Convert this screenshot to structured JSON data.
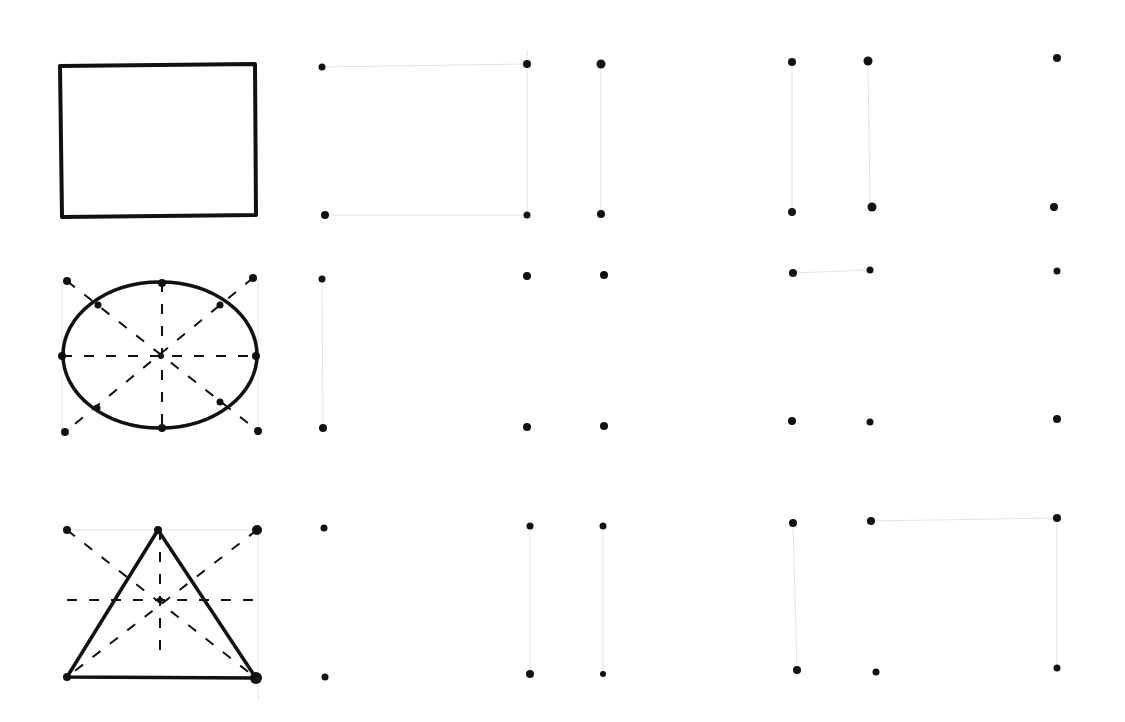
{
  "worksheet": {
    "type": "hand-drawn shape copying worksheet",
    "rows": [
      {
        "model_shape": "rectangle",
        "model_outline": [
          [
            60,
            66
          ],
          [
            255,
            64
          ],
          [
            256,
            215
          ],
          [
            62,
            217
          ]
        ],
        "guide_points": [],
        "guide_lines": [],
        "dot_grids": [
          {
            "dots": [
              [
                322,
                67
              ],
              [
                527,
                64
              ],
              [
                601,
                64
              ],
              [
                325,
                215
              ],
              [
                527,
                215
              ],
              [
                601,
                214
              ]
            ]
          },
          {
            "dots": [
              [
                792,
                62
              ],
              [
                868,
                61
              ],
              [
                1057,
                58
              ],
              [
                792,
                212
              ],
              [
                872,
                207
              ],
              [
                1054,
                207
              ]
            ]
          }
        ]
      },
      {
        "model_shape": "ellipse",
        "model_outline": {
          "cx": 160,
          "cy": 355,
          "rx": 98,
          "ry": 73
        },
        "guide_points": [
          [
            67,
            281
          ],
          [
            253,
            278
          ],
          [
            65,
            432
          ],
          [
            258,
            431
          ],
          [
            162,
            282
          ],
          [
            62,
            356
          ],
          [
            256,
            356
          ],
          [
            162,
            428
          ],
          [
            98,
            305
          ],
          [
            220,
            305
          ],
          [
            97,
            408
          ],
          [
            220,
            402
          ],
          [
            160,
            355
          ]
        ],
        "guide_lines": "dashed diagonals, horizontal and vertical through center",
        "dot_grids": [
          {
            "dots": [
              [
                322,
                279
              ],
              [
                527,
                276
              ],
              [
                604,
                275
              ],
              [
                323,
                428
              ],
              [
                527,
                427
              ],
              [
                604,
                426
              ]
            ]
          },
          {
            "dots": [
              [
                793,
                273
              ],
              [
                870,
                270
              ],
              [
                1057,
                271
              ],
              [
                792,
                421
              ],
              [
                870,
                422
              ],
              [
                1057,
                419
              ]
            ]
          }
        ]
      },
      {
        "model_shape": "triangle",
        "model_outline": [
          [
            158,
            530
          ],
          [
            67,
            677
          ],
          [
            256,
            678
          ]
        ],
        "guide_points": [
          [
            67,
            530
          ],
          [
            257,
            530
          ],
          [
            158,
            600
          ]
        ],
        "guide_lines": "dashed diagonals, horizontal and vertical through center",
        "dot_grids": [
          {
            "dots": [
              [
                324,
                528
              ],
              [
                530,
                526
              ],
              [
                603,
                526
              ],
              [
                325,
                677
              ],
              [
                530,
                674
              ],
              [
                603,
                674
              ]
            ]
          },
          {
            "dots": [
              [
                793,
                523
              ],
              [
                871,
                521
              ],
              [
                1057,
                518
              ],
              [
                797,
                670
              ],
              [
                876,
                672
              ],
              [
                1057,
                668
              ]
            ]
          }
        ]
      }
    ],
    "colors": {
      "ink": "#111111",
      "faint_guide": "#d8d8d8",
      "paper": "#ffffff"
    }
  }
}
